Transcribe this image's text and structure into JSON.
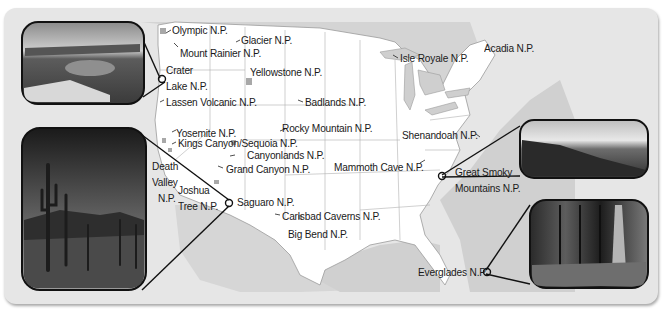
{
  "map": {
    "title": "U.S. National Parks",
    "colors": {
      "frame": "#e6e6e6",
      "land_us": "#ffffff",
      "land_other": "#d4d4d4",
      "water": "#cfcfcf",
      "park_marker": "#a8a8a8",
      "borders": "#9a9a9a",
      "text": "#1a1a1a"
    },
    "parks": [
      {
        "id": "olympic",
        "label": "Olympic N.P."
      },
      {
        "id": "glacier",
        "label": "Glacier N.P."
      },
      {
        "id": "mount-rainier",
        "label": "Mount Rainier N.P."
      },
      {
        "id": "crater-lake",
        "label": "Crater Lake N.P.",
        "label_lines": [
          "Crater",
          "Lake N.P."
        ]
      },
      {
        "id": "yellowstone",
        "label": "Yellowstone N.P."
      },
      {
        "id": "lassen-volcanic",
        "label": "Lassen Volcanic N.P."
      },
      {
        "id": "badlands",
        "label": "Badlands N.P."
      },
      {
        "id": "isle-royale",
        "label": "Isle Royale N.P."
      },
      {
        "id": "acadia",
        "label": "Acadia N.P."
      },
      {
        "id": "yosemite",
        "label": "Yosemite N.P."
      },
      {
        "id": "rocky-mountain",
        "label": "Rocky Mountain N.P."
      },
      {
        "id": "kings-canyon-sequoia",
        "label": "Kings Canyon/Sequoia N.P."
      },
      {
        "id": "shenandoah",
        "label": "Shenandoah N.P."
      },
      {
        "id": "canyonlands",
        "label": "Canyonlands N.P."
      },
      {
        "id": "death-valley",
        "label": "Death Valley N.P.",
        "label_lines": [
          "Death",
          "Valley",
          "N.P."
        ]
      },
      {
        "id": "grand-canyon",
        "label": "Grand Canyon N.P."
      },
      {
        "id": "mammoth-cave",
        "label": "Mammoth Cave N.P."
      },
      {
        "id": "great-smoky",
        "label": "Great Smoky Mountains N.P.",
        "label_lines": [
          "Great Smoky",
          "Mountains N.P."
        ]
      },
      {
        "id": "joshua-tree",
        "label": "Joshua Tree N.P.",
        "label_lines": [
          "Joshua",
          "Tree N.P."
        ]
      },
      {
        "id": "saguaro",
        "label": "Saguaro N.P."
      },
      {
        "id": "carlsbad-caverns",
        "label": "Carlsbad Caverns N.P."
      },
      {
        "id": "big-bend",
        "label": "Big Bend N.P."
      },
      {
        "id": "everglades",
        "label": "Everglades N.P."
      }
    ],
    "photos": [
      {
        "id": "crater-lake-photo",
        "subject": "Crater Lake with Wizard Island",
        "linked_park": "crater-lake"
      },
      {
        "id": "saguaro-photo",
        "subject": "Saguaro cactus desert",
        "linked_park": "saguaro"
      },
      {
        "id": "great-smoky-photo",
        "subject": "Forested mountain ridges",
        "linked_park": "great-smoky"
      },
      {
        "id": "everglades-photo",
        "subject": "Cypress swamp",
        "linked_park": "everglades"
      }
    ]
  }
}
